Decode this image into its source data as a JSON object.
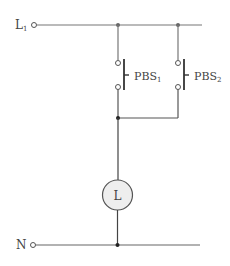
{
  "diagram": {
    "terminals": {
      "line": {
        "label": "L",
        "subscript": "1"
      },
      "neutral": {
        "label": "N"
      }
    },
    "switches": [
      {
        "label": "PBS",
        "subscript": "1"
      },
      {
        "label": "PBS",
        "subscript": "2"
      }
    ],
    "lamp": {
      "label": "L"
    },
    "colors": {
      "wire": "#555555",
      "lamp_fill": "#eeeeee",
      "text": "#444444"
    }
  }
}
